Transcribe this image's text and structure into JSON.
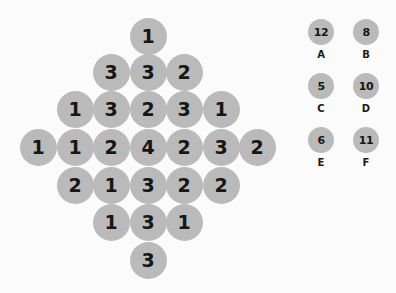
{
  "board": {
    "rows": [
      [
        "1"
      ],
      [
        "3",
        "3",
        "2"
      ],
      [
        "1",
        "3",
        "2",
        "3",
        "1"
      ],
      [
        "1",
        "1",
        "2",
        "4",
        "2",
        "3",
        "2"
      ],
      [
        "2",
        "1",
        "3",
        "2",
        "2"
      ],
      [
        "1",
        "3",
        "1"
      ],
      [
        "3"
      ]
    ],
    "cells": [
      {
        "value": "1",
        "row": 0,
        "col": 3
      },
      {
        "value": "3",
        "row": 1,
        "col": 2
      },
      {
        "value": "3",
        "row": 1,
        "col": 3
      },
      {
        "value": "2",
        "row": 1,
        "col": 4
      },
      {
        "value": "1",
        "row": 2,
        "col": 1
      },
      {
        "value": "3",
        "row": 2,
        "col": 2
      },
      {
        "value": "2",
        "row": 2,
        "col": 3
      },
      {
        "value": "3",
        "row": 2,
        "col": 4
      },
      {
        "value": "1",
        "row": 2,
        "col": 5
      },
      {
        "value": "1",
        "row": 3,
        "col": 0
      },
      {
        "value": "1",
        "row": 3,
        "col": 1
      },
      {
        "value": "2",
        "row": 3,
        "col": 2
      },
      {
        "value": "4",
        "row": 3,
        "col": 3
      },
      {
        "value": "2",
        "row": 3,
        "col": 4
      },
      {
        "value": "3",
        "row": 3,
        "col": 5
      },
      {
        "value": "2",
        "row": 3,
        "col": 6
      },
      {
        "value": "2",
        "row": 4,
        "col": 1
      },
      {
        "value": "1",
        "row": 4,
        "col": 2
      },
      {
        "value": "3",
        "row": 4,
        "col": 3
      },
      {
        "value": "2",
        "row": 4,
        "col": 4
      },
      {
        "value": "2",
        "row": 4,
        "col": 5
      },
      {
        "value": "1",
        "row": 5,
        "col": 2
      },
      {
        "value": "3",
        "row": 5,
        "col": 3
      },
      {
        "value": "1",
        "row": 5,
        "col": 4
      },
      {
        "value": "3",
        "row": 6,
        "col": 3
      }
    ]
  },
  "legend": [
    {
      "label": "A",
      "value": "12"
    },
    {
      "label": "B",
      "value": "8"
    },
    {
      "label": "C",
      "value": "5"
    },
    {
      "label": "D",
      "value": "10"
    },
    {
      "label": "E",
      "value": "6"
    },
    {
      "label": "F",
      "value": "11"
    }
  ],
  "colors": {
    "background": "#fbfbfb",
    "circle": "#bababa",
    "text": "#161616"
  }
}
